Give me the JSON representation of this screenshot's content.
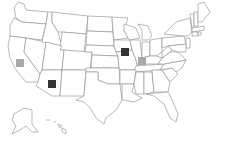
{
  "map": {
    "title": "United States map with state markers",
    "background": "#ffffff",
    "border_color": "#8a8a8a",
    "markers": [
      {
        "state": "California",
        "x": 16,
        "y": 59,
        "color": "#a9a9a9",
        "level": "light"
      },
      {
        "state": "Arizona",
        "x": 48,
        "y": 80,
        "color": "#333333",
        "level": "dark"
      },
      {
        "state": "Iowa",
        "x": 121,
        "y": 48,
        "color": "#333333",
        "level": "dark"
      },
      {
        "state": "Illinois",
        "x": 138,
        "y": 57,
        "color": "#a9a9a9",
        "level": "light"
      }
    ]
  }
}
